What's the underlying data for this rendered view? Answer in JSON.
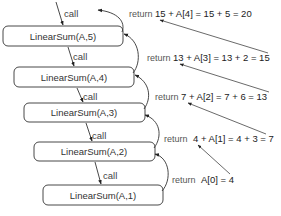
{
  "diagram": {
    "type": "recursion-trace",
    "calls": [
      {
        "label": "LinearSum(A,5)",
        "call_label": "call"
      },
      {
        "label": "LinearSum(A,4)",
        "call_label": "call"
      },
      {
        "label": "LinearSum(A,3)",
        "call_label": "call"
      },
      {
        "label": "LinearSum(A,2)",
        "call_label": "call"
      },
      {
        "label": "LinearSum(A,1)",
        "call_label": "call"
      }
    ],
    "returns": [
      {
        "word": "return",
        "expr": "15 + A[4] = 15 + 5 = 20"
      },
      {
        "word": "return",
        "expr": "13 + A[3] = 13 + 2 = 15"
      },
      {
        "word": "return",
        "expr": "7 + A[2] = 7 + 6 = 13"
      },
      {
        "word": "return",
        "expr": "4 + A[1] = 4 + 3 = 7"
      },
      {
        "word": "return",
        "expr": "A[0] = 4"
      }
    ],
    "colors": {
      "stroke": "#333333",
      "box_fill": "#ffffff",
      "text": "#222222"
    }
  }
}
